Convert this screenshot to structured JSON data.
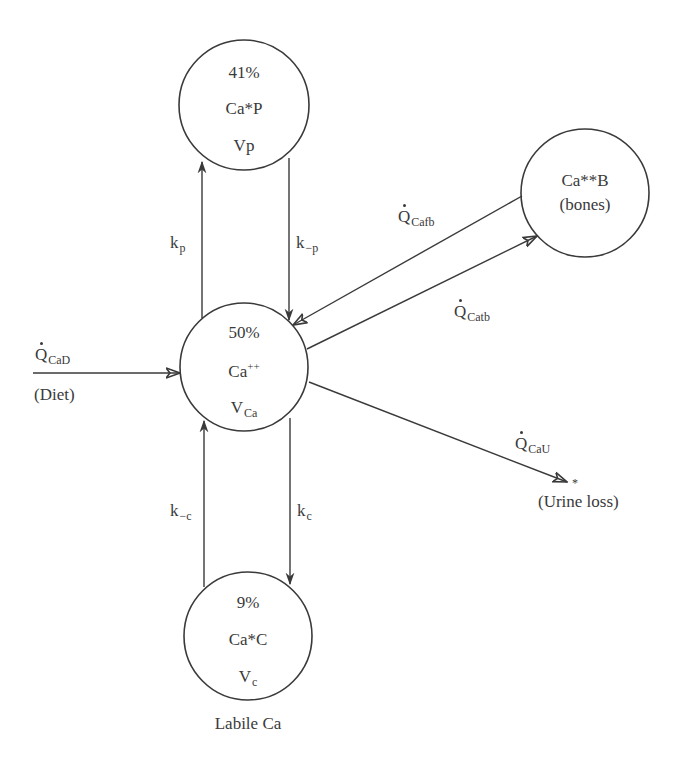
{
  "diagram": {
    "colors": {
      "stroke": "#3a3a3a",
      "background": "#ffffff",
      "text": "#3a3a3a"
    },
    "nodes": {
      "plasma": {
        "percent": "41%",
        "species": "Ca*P",
        "volume": "Vp"
      },
      "central": {
        "percent": "50%",
        "species_base": "Ca",
        "species_sup": "++",
        "volume_base": "V",
        "volume_sub": "Ca"
      },
      "cellular": {
        "percent": "9%",
        "species": "Ca*C",
        "volume_base": "V",
        "volume_sub": "c",
        "caption": "Labile Ca"
      },
      "bones": {
        "species": "Ca**B",
        "note": "(bones)"
      }
    },
    "edges": {
      "kp": {
        "base": "k",
        "sub": "p"
      },
      "k_minus_p": {
        "base": "k",
        "sub": "−p"
      },
      "k_minus_c": {
        "base": "k",
        "sub": "−c"
      },
      "kc": {
        "base": "k",
        "sub": "c"
      },
      "diet_flow": {
        "base": "Q",
        "sub": "CaD",
        "caption": "(Diet)"
      },
      "bone_formation": {
        "base": "Q",
        "sub": "Cafb"
      },
      "bone_resorption": {
        "base": "Q",
        "sub": "Catb"
      },
      "urine_flow": {
        "base": "Q",
        "sub": "CaU",
        "caption": "(Urine loss)",
        "sink_marker": "*"
      }
    }
  }
}
